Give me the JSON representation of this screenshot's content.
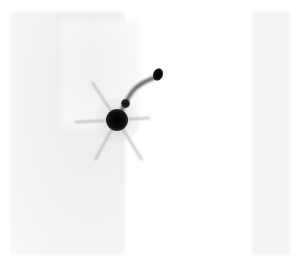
{
  "image": {
    "description": "Grayscale planar scintigraphy-style image with a dense focal uptake and a curved tubular tract leading to a second focus",
    "colors": {
      "background": "#ffffff",
      "field": "#f1f1f1",
      "uptake": "#111111"
    },
    "regions": [
      {
        "name": "left-field",
        "x": 10,
        "y": 12,
        "w": 115,
        "h": 243
      },
      {
        "name": "right-field",
        "x": 252,
        "y": 12,
        "w": 38,
        "h": 243
      }
    ],
    "foci": [
      {
        "name": "main-focus",
        "cx": 117,
        "cy": 120,
        "r": 10
      },
      {
        "name": "mid-focus",
        "cx": 125,
        "cy": 103,
        "r": 4
      },
      {
        "name": "upper-focus",
        "cx": 158,
        "cy": 74,
        "r": 6
      }
    ]
  }
}
